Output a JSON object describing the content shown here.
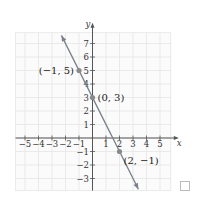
{
  "chart_data": {
    "type": "line",
    "title": "",
    "xlabel": "x",
    "ylabel": "y",
    "xlim": [
      -5.7,
      5.8
    ],
    "ylim": [
      -3.9,
      7.8
    ],
    "grid": true,
    "x_ticks": [
      -5,
      -4,
      -3,
      -2,
      -1,
      1,
      2,
      3,
      4,
      5
    ],
    "x_tick_labels": [
      "−5",
      "−4",
      "−3",
      "−2",
      "−1",
      "1",
      "2",
      "3",
      "4",
      "5"
    ],
    "y_ticks": [
      -3,
      -2,
      -1,
      1,
      2,
      3,
      4,
      5,
      6,
      7
    ],
    "y_tick_labels": [
      "−3",
      "−2",
      "−1",
      "1",
      "2",
      "3",
      "4",
      "5",
      "6",
      "7"
    ],
    "series": [
      {
        "name": "y = -2x + 3",
        "slope": -2,
        "intercept": 3,
        "x": [
          -2.3,
          3.4
        ],
        "y": [
          7.6,
          -3.8
        ]
      }
    ],
    "points": [
      {
        "x": -1,
        "y": 5,
        "label": "(−1, 5)"
      },
      {
        "x": 0,
        "y": 3,
        "label": "(0, 3)"
      },
      {
        "x": 2,
        "y": -1,
        "label": "(2, −1)"
      }
    ],
    "colors": {
      "line": "#7a7f8a",
      "point": "#8a8a8a",
      "axis": "#555555",
      "grid": "#e6e6e6"
    }
  },
  "checkbox": {
    "checked": false
  }
}
